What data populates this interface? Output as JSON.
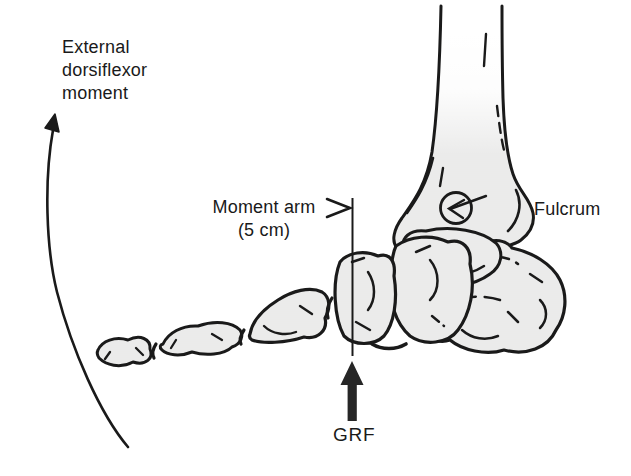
{
  "diagram": {
    "labels": {
      "external_moment": {
        "line1": "External",
        "line2": "dorsiflexor",
        "line3": "moment"
      },
      "moment_arm": {
        "line1": "Moment arm",
        "line2": "(5 cm)"
      },
      "fulcrum": "Fulcrum",
      "grf": "GRF"
    },
    "annotations": {
      "moment_arm_value": "5 cm",
      "fulcrum_location": "ankle joint",
      "grf_direction": "upward",
      "external_moment_direction": "counterclockwise"
    },
    "colors": {
      "ink": "#1a1a1a",
      "bone_fill": "#f2f2f1",
      "bone_texture_line": "#e1e1df",
      "arrow_fill": "#262626",
      "background": "#ffffff"
    },
    "icons": [
      "dorsiflexor-moment-curved-arrow",
      "moment-arm-chevron-icon",
      "grf-line-of-action",
      "grf-force-arrow-icon",
      "fulcrum-pointer-arrow-icon",
      "fulcrum-circle-icon"
    ]
  }
}
